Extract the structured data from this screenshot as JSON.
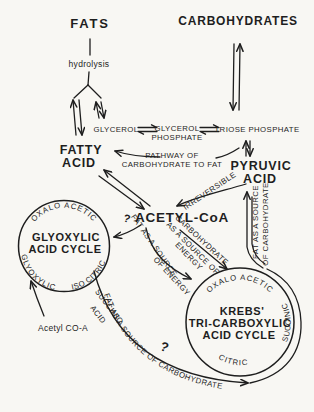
{
  "colors": {
    "ink": "#1e1e1e",
    "paper": "#f8f7f3"
  },
  "top": {
    "fats": "FATS",
    "carbohydrates": "CARBOHYDRATES",
    "hydrolysis": "hydrolysis",
    "glycerol": "GLYCEROL",
    "glycerol_phosphate_line1": "GLYCEROL",
    "glycerol_phosphate_line2": "PHOSPHATE",
    "triose_phosphate": "TRIOSE PHOSPHATE"
  },
  "middle": {
    "fatty_line1": "FATTY",
    "fatty_line2": "ACID",
    "pathway_line1": "PATHWAY OF",
    "pathway_line2": "CARBOHYDRATE TO FAT",
    "pyruvic_line1": "PYRUVIC",
    "pyruvic_line2": "ACID",
    "irreversible": "IRREVERSIBLE",
    "acetyl_coa": "ACETYL-CoA",
    "question_mark": "?"
  },
  "branches": {
    "fat_energy_line1": "FAT AS A SOURCE",
    "fat_energy_line2": "OF ENERGY",
    "carb_energy_line1": "CARBOHYDRATE",
    "carb_energy_line2": "AS A SOURCE OF",
    "carb_energy_line3": "ENERGY",
    "fat_carb_vertical_line1": "FAT AS A SOURCE",
    "fat_carb_vertical_line2": "OF CARBOHYDRATE"
  },
  "glyoxylic": {
    "title_line1": "GLYOXYLIC",
    "title_line2": "ACID CYCLE",
    "arc_top": "OXALO ACETIC",
    "arc_left": "GLYOXYLIC",
    "arc_right": "ISO CITRIC",
    "acetyl_coa_small": "Acetyl CO-A"
  },
  "krebs": {
    "title_line1": "KREBS'",
    "title_line2": "TRI-CARBOXYLIC",
    "title_line3": "ACID CYCLE",
    "arc_top": "OXALO ACETIC",
    "arc_right": "SUCCINIC",
    "arc_bottom": "CITRIC"
  },
  "bottom": {
    "succinic_line1": "SUCCINIC",
    "succinic_line2": "ACID",
    "fat_carb_curve": "FAT AS A SOURCE OF CARBOHYDRATE",
    "question_mark": "?"
  }
}
